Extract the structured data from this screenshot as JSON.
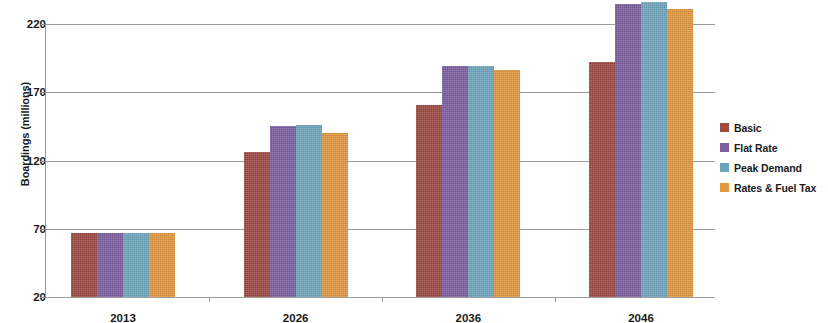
{
  "chart_data": {
    "type": "bar",
    "title": "",
    "xlabel": "",
    "ylabel": "Boardings (millions)",
    "categories": [
      "2013",
      "2026",
      "2036",
      "2046"
    ],
    "ylim": [
      20,
      220
    ],
    "yticks": [
      20,
      70,
      120,
      170,
      220
    ],
    "ytick_labels": [
      "20",
      "70",
      "120",
      "170",
      "220"
    ],
    "grid": true,
    "legend_position": "right",
    "series": [
      {
        "name": "Basic",
        "color": "#9c4a42",
        "values": [
          67,
          126,
          161,
          192
        ]
      },
      {
        "name": "Flat Rate",
        "color": "#7d5fa0",
        "values": [
          67,
          145,
          189,
          235
        ]
      },
      {
        "name": "Peak Demand",
        "color": "#6ea5bd",
        "values": [
          67,
          146,
          189,
          236
        ]
      },
      {
        "name": "Rates & Fuel Tax",
        "color": "#e2973f",
        "values": [
          67,
          140,
          186,
          231
        ]
      }
    ]
  }
}
